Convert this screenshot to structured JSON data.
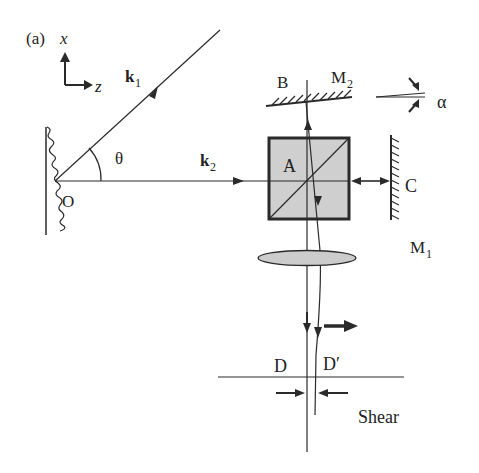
{
  "figure": {
    "panel_label": "(a)",
    "axes": {
      "x_label": "x",
      "z_label": "z"
    },
    "labels": {
      "k1": "k",
      "k1_sub": "1",
      "k2": "k",
      "k2_sub": "2",
      "theta": "θ",
      "origin": "O",
      "cube": "A",
      "mirror_b": "B",
      "mirror_m2": "M",
      "mirror_m2_sub": "2",
      "mirror_c": "C",
      "mirror_m1": "M",
      "mirror_m1_sub": "1",
      "alpha": "α",
      "point_d": "D",
      "point_d_prime": "D′",
      "shear": "Shear"
    },
    "colors": {
      "line": "#2a2a2a",
      "cube_fill": "#cfcfcf",
      "lens_fill": "#cccccc",
      "background": "#ffffff"
    }
  }
}
